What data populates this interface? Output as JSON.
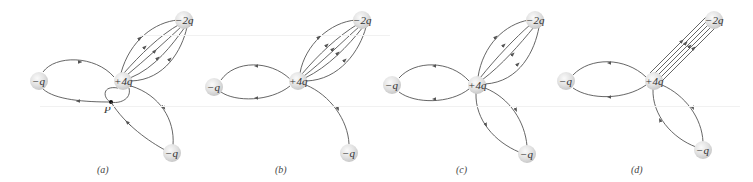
{
  "figure": {
    "colors": {
      "line": "#555555",
      "charge_fill": "#e4e4e4",
      "charge_edge": "#cfcfcf",
      "text": "#333333"
    },
    "panels": [
      {
        "id": "a",
        "label": "(a)",
        "charges": [
          {
            "name": "left",
            "text": "−q",
            "x": 39,
            "y": 81
          },
          {
            "name": "center",
            "text": "+4q",
            "x": 123,
            "y": 81
          },
          {
            "name": "top",
            "text": "−2q",
            "x": 184,
            "y": 20
          },
          {
            "name": "bottom",
            "text": "−q",
            "x": 172,
            "y": 153
          }
        ],
        "point": {
          "text": "P",
          "x": 111,
          "y": 102
        }
      },
      {
        "id": "b",
        "label": "(b)",
        "charges": [
          {
            "name": "left",
            "text": "−q",
            "x": 214,
            "y": 87
          },
          {
            "name": "center",
            "text": "+4q",
            "x": 298,
            "y": 81
          },
          {
            "name": "top",
            "text": "−2q",
            "x": 362,
            "y": 20
          },
          {
            "name": "bottom",
            "text": "−q",
            "x": 349,
            "y": 153
          }
        ]
      },
      {
        "id": "c",
        "label": "(c)",
        "charges": [
          {
            "name": "left",
            "text": "−q",
            "x": 392,
            "y": 85
          },
          {
            "name": "center",
            "text": "+4q",
            "x": 477,
            "y": 85
          },
          {
            "name": "top",
            "text": "−2q",
            "x": 535,
            "y": 20
          },
          {
            "name": "bottom",
            "text": "−q",
            "x": 527,
            "y": 154
          }
        ]
      },
      {
        "id": "d",
        "label": "(d)",
        "charges": [
          {
            "name": "left",
            "text": "−q",
            "x": 566,
            "y": 81
          },
          {
            "name": "center",
            "text": "+4q",
            "x": 654,
            "y": 81
          },
          {
            "name": "top",
            "text": "−2q",
            "x": 714,
            "y": 20
          },
          {
            "name": "bottom",
            "text": "−q",
            "x": 703,
            "y": 150
          }
        ]
      }
    ]
  }
}
